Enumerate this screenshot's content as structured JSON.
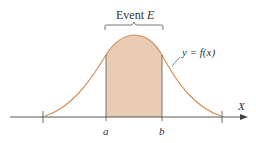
{
  "diagram": {
    "event_label": "Event ",
    "event_var": "E",
    "curve_label": "y = f(x)",
    "axis_label": "X",
    "a_label": "a",
    "b_label": "b",
    "colors": {
      "curve": "#d2935f",
      "fill": "#e8cdb4",
      "axis": "#444444",
      "text": "#333333"
    }
  }
}
